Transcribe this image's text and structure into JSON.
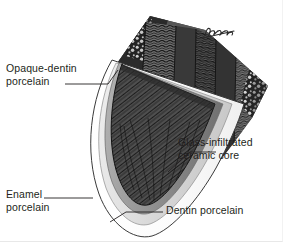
{
  "figure": {
    "background_color": "#ffffff",
    "ink_color": "#231f20",
    "signature": {
      "name": "artist-signature",
      "text": "illegible cursive signature"
    }
  },
  "labels": {
    "opaque_dentin": "Opaque-dentin\nporcelain",
    "enamel": "Enamel\nporcelain",
    "glass_core": "Glass-infiltrated\nceramic core",
    "dentin": "Dentin porcelain"
  },
  "layers": {
    "enamel_porcelain": {
      "name": "Enamel porcelain",
      "color": "#ffffff"
    },
    "dentin_porcelain": {
      "name": "Dentin porcelain",
      "color": "#e2e2e2"
    },
    "opaque_dentin_porcelain": {
      "name": "Opaque-dentin porcelain",
      "color": "#9a9a9a"
    },
    "glass_infiltrated_core": {
      "name": "Glass-infiltrated ceramic core",
      "color": "#4a4a4a"
    },
    "dark_substrate": {
      "name": "Tooth substrate",
      "color": "#2e2e2e"
    }
  }
}
